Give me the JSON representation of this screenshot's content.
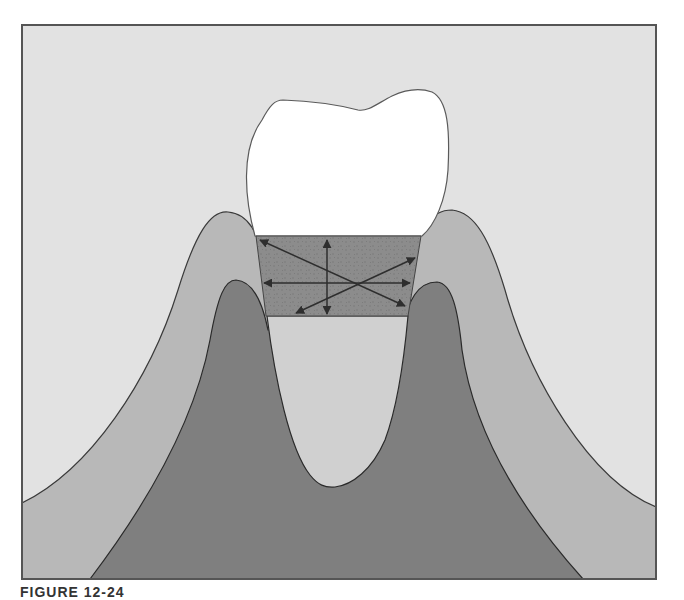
{
  "figure": {
    "caption": "FIGURE 12-24",
    "layers": [
      {
        "name": "background",
        "color": "#e2e2e2"
      },
      {
        "name": "gingiva",
        "color": "#b8b8b8"
      },
      {
        "name": "alveolar-bone",
        "color": "#7f7f7f"
      },
      {
        "name": "root",
        "color": "#d0d0d0"
      },
      {
        "name": "crown",
        "color": "#ffffff"
      },
      {
        "name": "fiber-band",
        "color": "#8c8c8c"
      }
    ],
    "outline_color": "#3a3a3a",
    "arrow_color": "#2e2e2e",
    "fiber_arrows": [
      {
        "name": "oblique-down-arrow",
        "direction": "top-left to bottom-right"
      },
      {
        "name": "horizontal-arrow",
        "direction": "left-right"
      },
      {
        "name": "vertical-arrow",
        "direction": "up-down"
      },
      {
        "name": "oblique-up-arrow",
        "direction": "bottom-left to top-right"
      }
    ]
  }
}
